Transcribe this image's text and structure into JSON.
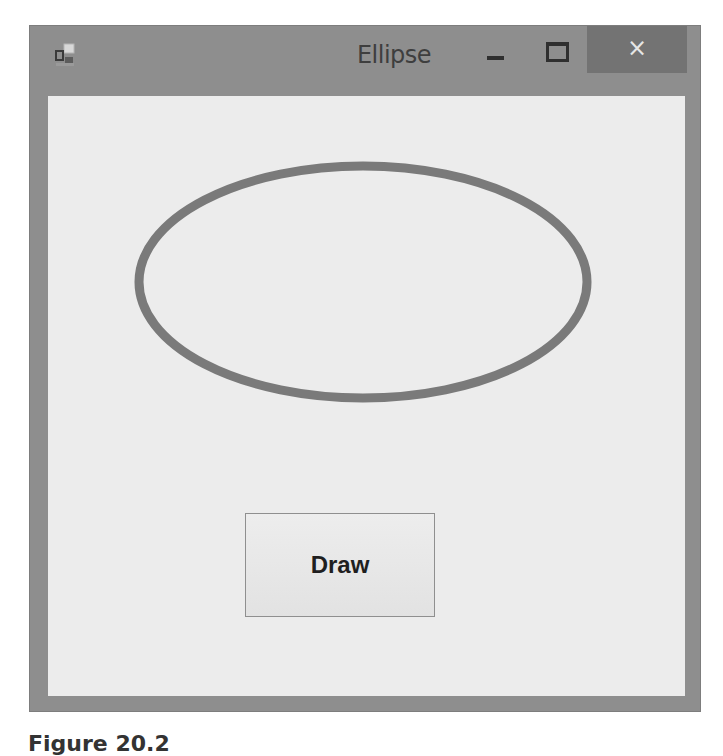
{
  "window": {
    "title": "Ellipse",
    "icon": "app-form-icon",
    "controls": {
      "minimize_icon": "minimize-icon",
      "maximize_icon": "maximize-icon",
      "close_icon": "close-icon",
      "close_glyph": "×"
    }
  },
  "canvas": {
    "shape": "ellipse",
    "stroke_color": "#7a7a7a",
    "stroke_width": 9,
    "center": {
      "x": 315,
      "y": 186
    },
    "radii": {
      "rx": 224,
      "ry": 116
    }
  },
  "buttons": {
    "draw_label": "Draw"
  },
  "caption": {
    "text": "Figure 20.2"
  },
  "colors": {
    "frame": "#8e8e8e",
    "close_button": "#737373",
    "client_background": "#ececec",
    "title_text": "#3e3e3e"
  }
}
